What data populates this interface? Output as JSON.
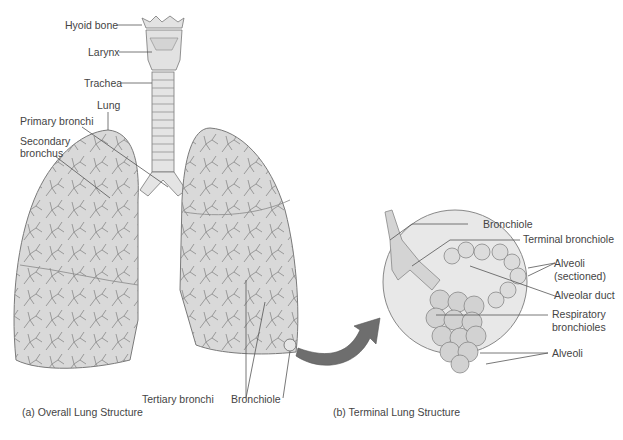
{
  "figure": {
    "panel_a": {
      "caption": "(a) Overall Lung Structure",
      "labels": {
        "hyoid": "Hyoid bone",
        "larynx": "Larynx",
        "trachea": "Trachea",
        "lung": "Lung",
        "primary": "Primary bronchi",
        "secondary_1": "Secondary",
        "secondary_2": "bronchus",
        "tertiary": "Tertiary bronchi",
        "bronchiole": "Bronchiole"
      }
    },
    "panel_b": {
      "caption": "(b) Terminal Lung Structure",
      "labels": {
        "bronchiole": "Bronchiole",
        "terminal": "Terminal bronchiole",
        "alv_sec_1": "Alveoli",
        "alv_sec_2": "(sectioned)",
        "duct": "Alveolar duct",
        "resp_1": "Respiratory",
        "resp_2": "bronchioles",
        "alveoli": "Alveoli"
      }
    },
    "colors": {
      "tissue": "#d9d9d9",
      "outline": "#7a7a7a",
      "arrow": "#6e6e6e",
      "leader": "#555555"
    }
  }
}
